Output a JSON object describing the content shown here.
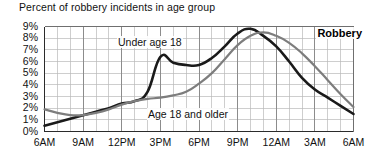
{
  "chart_data": {
    "type": "line",
    "title": "Percent of robbery incidents in age group",
    "xlabel": "",
    "ylabel": "",
    "annotation": "Robbery",
    "grid": true,
    "legend_position": "inline-annotations",
    "ylim": [
      0,
      9
    ],
    "ytick_labels": [
      "9%",
      "8%",
      "7%",
      "6%",
      "5%",
      "4%",
      "3%",
      "2%",
      "1%",
      "0%"
    ],
    "ytick_values": [
      9,
      8,
      7,
      6,
      5,
      4,
      3,
      2,
      1,
      0
    ],
    "xtick_labels": [
      "6AM",
      "9AM",
      "12PM",
      "3PM",
      "6PM",
      "9PM",
      "12AM",
      "3AM",
      "6AM"
    ],
    "xtick_hours": [
      0,
      3,
      6,
      9,
      12,
      15,
      18,
      21,
      24
    ],
    "x_hours": [
      0,
      1,
      2,
      3,
      4,
      5,
      6,
      7,
      8,
      9,
      10,
      11,
      12,
      13,
      14,
      15,
      16,
      17,
      18,
      19,
      20,
      21,
      22,
      23,
      24
    ],
    "series": [
      {
        "name": "Under age 18",
        "color": "#1a1a1a",
        "width": 2.6,
        "values": [
          0.5,
          0.8,
          1.1,
          1.4,
          1.7,
          2.0,
          2.4,
          2.6,
          3.4,
          6.4,
          5.9,
          5.7,
          5.7,
          6.3,
          7.3,
          8.4,
          8.8,
          8.2,
          7.3,
          6.0,
          4.6,
          3.6,
          2.9,
          2.2,
          1.5
        ]
      },
      {
        "name": "Age 18 and older",
        "color": "#7d7d7d",
        "width": 2.2,
        "values": [
          1.9,
          1.6,
          1.4,
          1.4,
          1.6,
          1.9,
          2.3,
          2.6,
          2.8,
          2.9,
          3.1,
          3.4,
          4.1,
          5.0,
          6.2,
          7.4,
          8.2,
          8.5,
          8.2,
          7.6,
          6.7,
          5.6,
          4.4,
          3.2,
          2.1
        ]
      }
    ]
  },
  "axis": {
    "y_labels": [
      "9%",
      "8%",
      "7%",
      "6%",
      "5%",
      "4%",
      "3%",
      "2%",
      "1%",
      "0%"
    ],
    "x_labels": [
      "6AM",
      "9AM",
      "12PM",
      "3PM",
      "6PM",
      "9PM",
      "12AM",
      "3AM",
      "6AM"
    ]
  },
  "annotations": {
    "under_18": "Under age 18",
    "adult": "Age 18 and older",
    "crime_type": "Robbery"
  }
}
